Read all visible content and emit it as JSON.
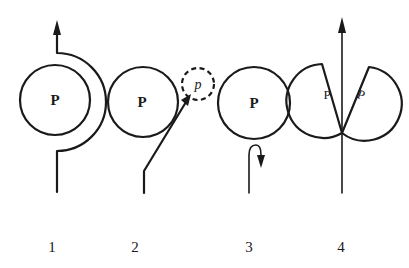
{
  "diagram": {
    "panels": [
      {
        "number": "1",
        "large_ball_label": "P",
        "description": "Path curves around the right side of ball P in a semicircle, continuing upward with arrow"
      },
      {
        "number": "2",
        "large_ball_label": "P",
        "small_ball_label": "p",
        "description": "Path goes diagonally up-right grazing ball P toward a dashed small ball p"
      },
      {
        "number": "3",
        "large_ball_label": "P",
        "description": "Path comes up under ball P and hooks back downward"
      },
      {
        "number": "4",
        "left_piece_label": "P",
        "right_piece_label": "P",
        "description": "Ball split into two pieces with straight path passing through the middle upward"
      }
    ]
  }
}
